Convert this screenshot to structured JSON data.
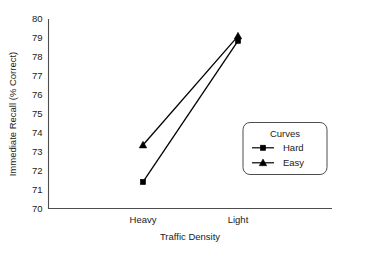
{
  "chart_data": {
    "type": "line",
    "title": "",
    "xlabel": "Traffic Density",
    "ylabel": "Immediate Recall (% Correct)",
    "categories": [
      "Heavy",
      "Light"
    ],
    "ylim": [
      70,
      80
    ],
    "yticks": [
      "70",
      "71",
      "72",
      "73",
      "74",
      "75",
      "76",
      "77",
      "78",
      "79",
      "80"
    ],
    "grid": false,
    "legend": {
      "title": "Curves",
      "position": "inside-right",
      "entries": [
        {
          "name": "Hard",
          "marker": "square"
        },
        {
          "name": "Easy",
          "marker": "triangle"
        }
      ]
    },
    "series": [
      {
        "name": "Hard",
        "marker": "square",
        "values": [
          71.4,
          78.85
        ]
      },
      {
        "name": "Easy",
        "marker": "triangle",
        "values": [
          73.35,
          79.1
        ]
      }
    ],
    "colors": {
      "series": "#000000",
      "axis": "#4d4d4d",
      "background": "#ffffff"
    }
  }
}
